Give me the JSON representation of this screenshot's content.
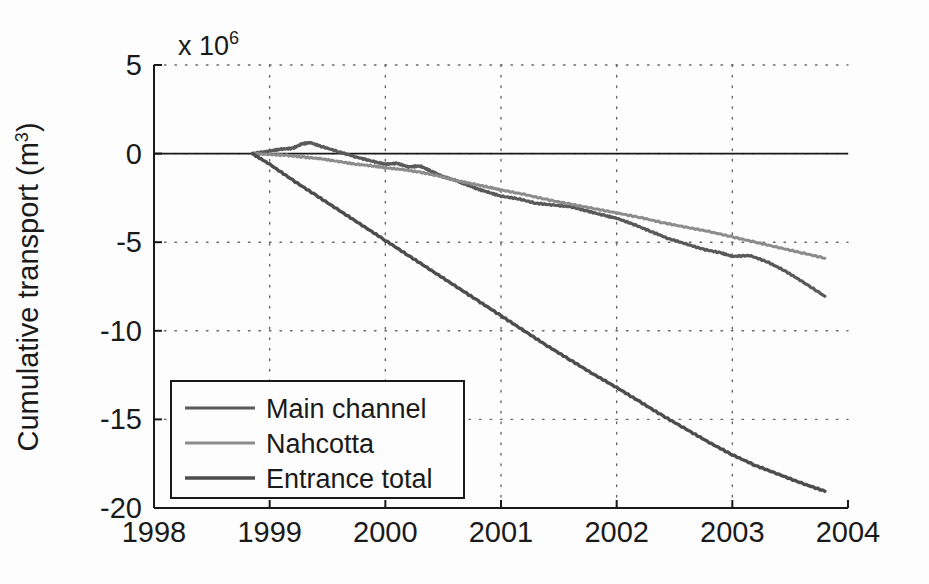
{
  "chart_data": {
    "type": "line",
    "title": "",
    "xlabel": "",
    "ylabel": "Cumulative transport (m",
    "ylabel_sup": "3",
    "ylabel_tail": ")",
    "y_exponent_text": "x 10",
    "y_exponent_sup": "6",
    "y_scale_factor": 1000000,
    "xlim": [
      1998,
      2004
    ],
    "ylim": [
      -20,
      5
    ],
    "xticks": [
      1998,
      1999,
      2000,
      2001,
      2002,
      2003,
      2004
    ],
    "xtick_labels": [
      "1998",
      "1999",
      "2000",
      "2001",
      "2002",
      "2003",
      "2004"
    ],
    "yticks": [
      5,
      0,
      -5,
      -10,
      -15,
      -20
    ],
    "ytick_labels": [
      "5",
      "0",
      "-5",
      "-10",
      "-15",
      "-20"
    ],
    "grid": true,
    "grid_style": "dotted",
    "legend_position": "lower left",
    "zero_line": true,
    "series": [
      {
        "name": "Main channel",
        "color": "#595959",
        "width": 3.2,
        "x": [
          1998.85,
          1999.0,
          1999.1,
          1999.2,
          1999.28,
          1999.35,
          1999.45,
          1999.6,
          1999.75,
          1999.9,
          2000.0,
          2000.1,
          2000.2,
          2000.3,
          2000.4,
          2000.5,
          2000.6,
          2000.7,
          2000.8,
          2000.9,
          2001.0,
          2001.15,
          2001.3,
          2001.45,
          2001.6,
          2001.75,
          2001.9,
          2002.0,
          2002.15,
          2002.3,
          2002.45,
          2002.6,
          2002.75,
          2002.9,
          2003.0,
          2003.15,
          2003.3,
          2003.45,
          2003.6,
          2003.8
        ],
        "y": [
          0.0,
          0.15,
          0.25,
          0.3,
          0.55,
          0.62,
          0.4,
          0.1,
          -0.2,
          -0.45,
          -0.6,
          -0.55,
          -0.75,
          -0.7,
          -1.0,
          -1.3,
          -1.5,
          -1.75,
          -2.0,
          -2.2,
          -2.4,
          -2.55,
          -2.8,
          -2.9,
          -3.0,
          -3.25,
          -3.5,
          -3.65,
          -4.0,
          -4.4,
          -4.8,
          -5.1,
          -5.4,
          -5.6,
          -5.8,
          -5.75,
          -6.1,
          -6.6,
          -7.2,
          -8.05
        ]
      },
      {
        "name": "Nahcotta",
        "color": "#8c8c8c",
        "width": 3.0,
        "x": [
          1998.85,
          1999.0,
          1999.15,
          1999.3,
          1999.45,
          1999.6,
          1999.75,
          1999.9,
          2000.0,
          2000.15,
          2000.3,
          2000.45,
          2000.6,
          2000.75,
          2000.9,
          2001.0,
          2001.2,
          2001.4,
          2001.6,
          2001.8,
          2002.0,
          2002.2,
          2002.4,
          2002.6,
          2002.8,
          2003.0,
          2003.2,
          2003.4,
          2003.6,
          2003.8
        ],
        "y": [
          0.0,
          -0.05,
          -0.1,
          -0.2,
          -0.3,
          -0.45,
          -0.6,
          -0.7,
          -0.8,
          -0.9,
          -1.05,
          -1.25,
          -1.5,
          -1.7,
          -1.9,
          -2.05,
          -2.3,
          -2.6,
          -2.85,
          -3.1,
          -3.35,
          -3.6,
          -3.9,
          -4.15,
          -4.4,
          -4.7,
          -5.0,
          -5.3,
          -5.6,
          -5.9
        ]
      },
      {
        "name": "Entrance total",
        "color": "#4d4d4d",
        "width": 3.4,
        "x": [
          1998.85,
          1999.0,
          1999.2,
          1999.4,
          1999.6,
          1999.8,
          2000.0,
          2000.2,
          2000.4,
          2000.6,
          2000.8,
          2001.0,
          2001.2,
          2001.4,
          2001.6,
          2001.8,
          2002.0,
          2002.2,
          2002.4,
          2002.6,
          2002.8,
          2003.0,
          2003.2,
          2003.4,
          2003.6,
          2003.8
        ],
        "y": [
          0.0,
          -0.6,
          -1.5,
          -2.35,
          -3.2,
          -4.05,
          -4.9,
          -5.75,
          -6.6,
          -7.45,
          -8.3,
          -9.15,
          -10.0,
          -10.85,
          -11.65,
          -12.45,
          -13.2,
          -14.0,
          -14.8,
          -15.55,
          -16.3,
          -17.0,
          -17.6,
          -18.1,
          -18.6,
          -19.05
        ]
      }
    ]
  },
  "legend": {
    "entries": [
      {
        "label": "Main channel"
      },
      {
        "label": "Nahcotta"
      },
      {
        "label": "Entrance total"
      }
    ]
  }
}
